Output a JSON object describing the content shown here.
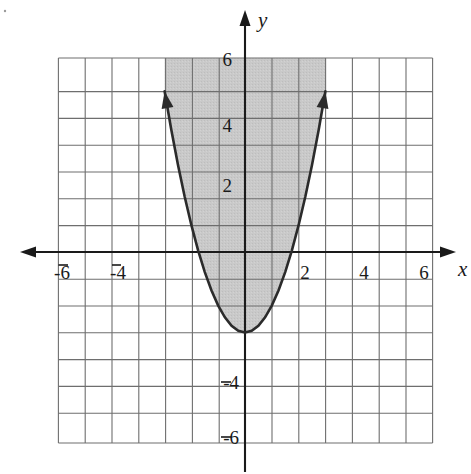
{
  "figure": {
    "title": "",
    "background_color": "#ffffff",
    "grid_color": "#6e6e6e",
    "axis_color": "#1a1a1a",
    "curve_color": "#2b2b2b",
    "shade_color": "#c9c9c9"
  },
  "axes": {
    "x_axis_label": "x",
    "y_axis_label": "y",
    "x_tick_labels": [
      "-6",
      "-4",
      "2",
      "4",
      "6"
    ],
    "y_tick_labels": [
      "6",
      "4",
      "2",
      "-4",
      "-6"
    ],
    "x_ticks_values": [
      -6,
      -4,
      2,
      4,
      6
    ],
    "y_ticks_values": [
      6,
      4,
      2,
      -4,
      -6
    ],
    "x_range": [
      -7,
      7
    ],
    "y_range": [
      -7,
      6
    ],
    "grid": "on",
    "grid_step": 1,
    "arrows": [
      "left",
      "right",
      "up",
      "down"
    ]
  },
  "chart_data": {
    "type": "line",
    "title": "",
    "xlabel": "x",
    "ylabel": "y",
    "xlim": [
      -7,
      7
    ],
    "ylim": [
      -7,
      6
    ],
    "grid": true,
    "legend": "none",
    "series": [
      {
        "name": "y = x^2 - 3",
        "equation": "y = x^2 - 3",
        "vertex": [
          0,
          -3
        ],
        "x_intercepts": [
          -1.73,
          1.73
        ],
        "y_intercept": -3,
        "endpoints_with_arrows": [
          [
            -3.0,
            6.0
          ],
          [
            3.0,
            6.0
          ]
        ],
        "x": [
          -3.0,
          -2.75,
          -2.5,
          -2.25,
          -2.0,
          -1.75,
          -1.5,
          -1.25,
          -1.0,
          -0.75,
          -0.5,
          -0.25,
          0,
          0.25,
          0.5,
          0.75,
          1.0,
          1.25,
          1.5,
          1.75,
          2.0,
          2.25,
          2.5,
          2.75,
          3.0
        ],
        "y": [
          6.0,
          4.5625,
          3.25,
          2.0625,
          1.0,
          0.0625,
          -0.75,
          -1.4375,
          -2.0,
          -2.4375,
          -2.75,
          -2.9375,
          -3.0,
          -2.9375,
          -2.75,
          -2.4375,
          -2.0,
          -1.4375,
          -0.75,
          0.0625,
          1.0,
          2.0625,
          3.25,
          4.5625,
          6.0
        ]
      }
    ],
    "shaded_region": {
      "label": "y >= x^2 - 3",
      "fill": "#c9c9c9",
      "bounded_above_by": "top of grid (y = 6)",
      "bounded_below_by": "parabola y = x^2 - 3"
    },
    "annotations": []
  }
}
